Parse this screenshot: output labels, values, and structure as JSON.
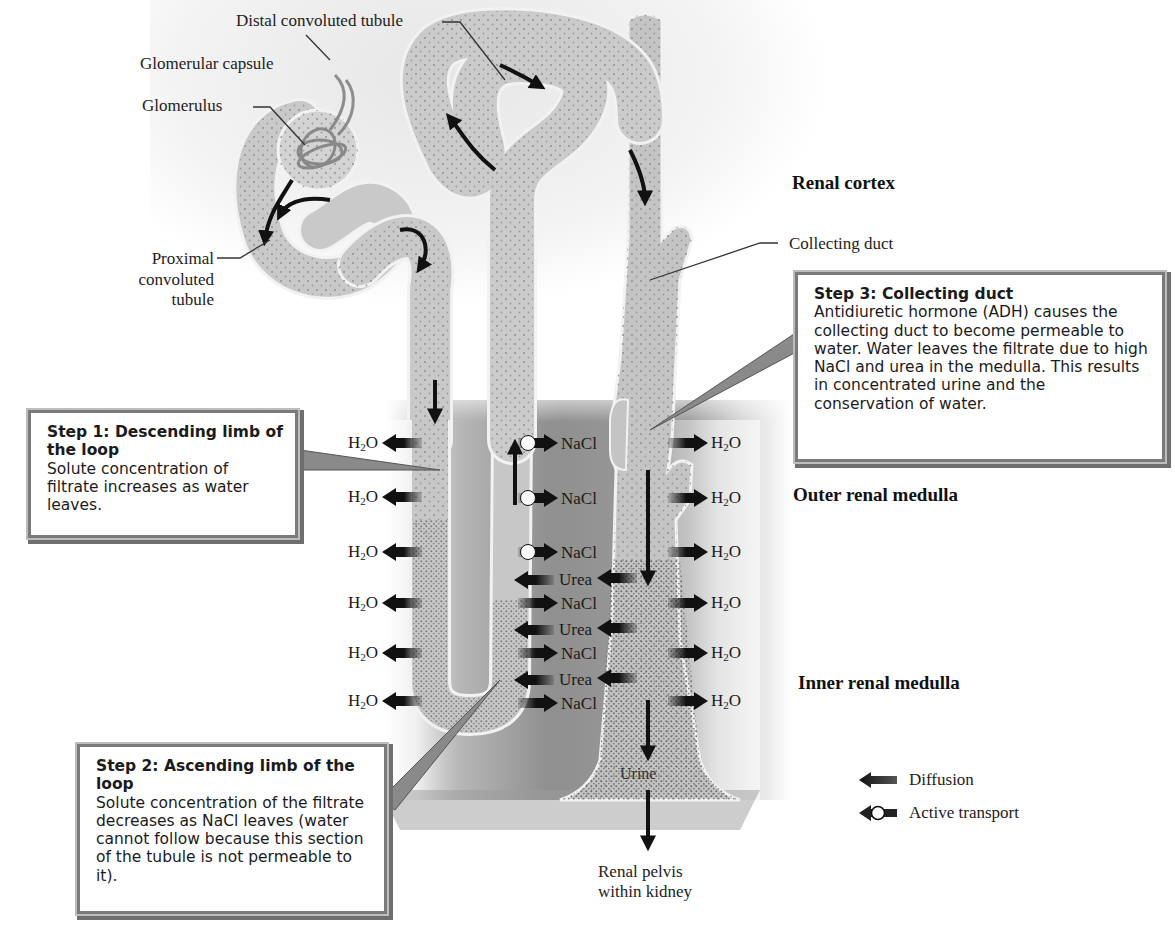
{
  "title_labels": {
    "distal": "Distal convoluted tubule",
    "glomerular_capsule": "Glomerular capsule",
    "glomerulus": "Glomerulus",
    "proximal": [
      "Proximal",
      "convoluted",
      "tubule"
    ],
    "collecting_duct": "Collecting duct",
    "urine": "Urine",
    "renal_pelvis": [
      "Renal pelvis",
      "within kidney"
    ]
  },
  "regions": {
    "cortex": "Renal cortex",
    "outer_medulla": "Outer renal medulla",
    "inner_medulla": "Inner renal medulla"
  },
  "steps": [
    {
      "title": "Step 1: Descending limb of the loop",
      "body": "Solute concentration of filtrate increases as water leaves."
    },
    {
      "title": "Step 2: Ascending limb of the loop",
      "body": "Solute concentration of the filtrate decreases as NaCl leaves (water cannot follow because this section of the tubule is not permeable to it)."
    },
    {
      "title": "Step 3: Collecting duct",
      "body": "Antidiuretic hormone (ADH) causes the collecting duct to become permeable to water.  Water leaves the filtrate due to high NaCl and urea in the medulla. This results in concentrated urine and the conservation of water."
    }
  ],
  "descending_flux": [
    {
      "species": "H2O",
      "direction": "out",
      "type": "diffusion"
    },
    {
      "species": "H2O",
      "direction": "out",
      "type": "diffusion"
    },
    {
      "species": "H2O",
      "direction": "out",
      "type": "diffusion"
    },
    {
      "species": "H2O",
      "direction": "out",
      "type": "diffusion"
    },
    {
      "species": "H2O",
      "direction": "out",
      "type": "diffusion"
    },
    {
      "species": "H2O",
      "direction": "out",
      "type": "diffusion"
    }
  ],
  "ascending_flux": [
    {
      "species": "NaCl",
      "type": "active transport"
    },
    {
      "species": "NaCl",
      "type": "active transport"
    },
    {
      "species": "NaCl",
      "type": "active transport"
    },
    {
      "species": "Urea",
      "type": "diffusion"
    },
    {
      "species": "NaCl",
      "type": "diffusion"
    },
    {
      "species": "Urea",
      "type": "diffusion"
    },
    {
      "species": "NaCl",
      "type": "diffusion"
    },
    {
      "species": "Urea",
      "type": "diffusion"
    },
    {
      "species": "NaCl",
      "type": "diffusion"
    }
  ],
  "collecting_flux": [
    {
      "species": "H2O",
      "type": "diffusion"
    },
    {
      "species": "H2O",
      "type": "diffusion"
    },
    {
      "species": "H2O",
      "type": "diffusion"
    },
    {
      "species": "H2O",
      "type": "diffusion"
    },
    {
      "species": "H2O",
      "type": "diffusion"
    },
    {
      "species": "H2O",
      "type": "diffusion"
    }
  ],
  "chem": {
    "h2o_base": "H",
    "h2o_sub": "2",
    "h2o_tail": "O",
    "nacl": "NaCl",
    "urea": "Urea"
  },
  "legend": {
    "diffusion": "Diffusion",
    "active_transport": "Active transport"
  },
  "colors": {
    "tubule_fill": "#c9c9c9",
    "medulla_dark": "#8c8c8c",
    "arrow": "#111111",
    "box_border": "#7a7a7a"
  }
}
